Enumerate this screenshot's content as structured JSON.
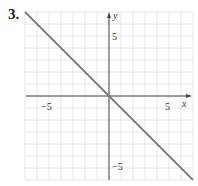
{
  "problem": {
    "number": "3."
  },
  "chart_data": {
    "type": "line",
    "title": "",
    "xlabel": "x",
    "ylabel": "y",
    "xlim": [
      -7,
      7
    ],
    "ylim": [
      -7,
      7
    ],
    "grid": true,
    "x_ticks": [
      {
        "value": -5,
        "label": "−5"
      },
      {
        "value": 5,
        "label": "5"
      }
    ],
    "y_ticks": [
      {
        "value": 5,
        "label": "5"
      },
      {
        "value": -5,
        "label": "−5"
      }
    ],
    "series": [
      {
        "name": "y = -x",
        "x": [
          -7,
          7
        ],
        "y": [
          7,
          -7
        ],
        "color": "#7a7a7a"
      }
    ]
  },
  "labels": {
    "x_axis": "x",
    "y_axis": "y",
    "x_tick_neg5": "−5",
    "x_tick_5": "5",
    "y_tick_5": "5",
    "y_tick_neg5": "−5"
  }
}
